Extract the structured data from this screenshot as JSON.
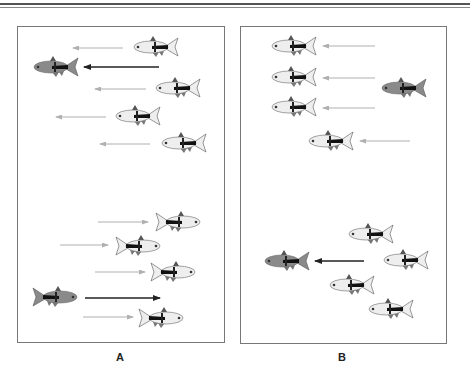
{
  "figure": {
    "panels": [
      {
        "id": "A",
        "label": "A",
        "description": "Followers track a leader moving left (top group) and right (bottom group)"
      },
      {
        "id": "B",
        "label": "B",
        "description": "Group moves left, leader separates; leader moves left, group remains"
      }
    ]
  },
  "colors": {
    "rule": "#555555",
    "panel_border": "#777777",
    "leader_arrow": "#222222",
    "follower_arrow": "#b0b0b0",
    "leader_fish_body": "#8a8a8a",
    "follower_fish_body": "#eeeeee"
  },
  "fish": [
    {
      "panel": "A",
      "type": "follower",
      "x": 132,
      "y": 47,
      "dir": "left"
    },
    {
      "panel": "A",
      "type": "leader",
      "x": 32,
      "y": 67,
      "dir": "left"
    },
    {
      "panel": "A",
      "type": "follower",
      "x": 154,
      "y": 88,
      "dir": "left"
    },
    {
      "panel": "A",
      "type": "follower",
      "x": 114,
      "y": 116,
      "dir": "left"
    },
    {
      "panel": "A",
      "type": "follower",
      "x": 160,
      "y": 143,
      "dir": "left"
    },
    {
      "panel": "A",
      "type": "follower",
      "x": 155,
      "y": 222,
      "dir": "right"
    },
    {
      "panel": "A",
      "type": "follower",
      "x": 115,
      "y": 246,
      "dir": "right"
    },
    {
      "panel": "A",
      "type": "follower",
      "x": 150,
      "y": 272,
      "dir": "right"
    },
    {
      "panel": "A",
      "type": "leader",
      "x": 32,
      "y": 297,
      "dir": "right"
    },
    {
      "panel": "A",
      "type": "follower",
      "x": 138,
      "y": 318,
      "dir": "right"
    },
    {
      "panel": "B",
      "type": "follower",
      "x": 270,
      "y": 46,
      "dir": "left"
    },
    {
      "panel": "B",
      "type": "follower",
      "x": 270,
      "y": 77,
      "dir": "left"
    },
    {
      "panel": "B",
      "type": "leader",
      "x": 380,
      "y": 88,
      "dir": "left"
    },
    {
      "panel": "B",
      "type": "follower",
      "x": 270,
      "y": 107,
      "dir": "left"
    },
    {
      "panel": "B",
      "type": "follower",
      "x": 307,
      "y": 141,
      "dir": "left"
    },
    {
      "panel": "B",
      "type": "follower",
      "x": 347,
      "y": 234,
      "dir": "left"
    },
    {
      "panel": "B",
      "type": "leader",
      "x": 263,
      "y": 261,
      "dir": "left"
    },
    {
      "panel": "B",
      "type": "follower",
      "x": 382,
      "y": 260,
      "dir": "left"
    },
    {
      "panel": "B",
      "type": "follower",
      "x": 328,
      "y": 285,
      "dir": "left"
    },
    {
      "panel": "B",
      "type": "follower",
      "x": 367,
      "y": 309,
      "dir": "left"
    }
  ],
  "arrows": [
    {
      "panel": "A",
      "type": "follower",
      "x1": 123,
      "x2": 73,
      "y": 48
    },
    {
      "panel": "A",
      "type": "leader",
      "x1": 159,
      "x2": 84,
      "y": 67
    },
    {
      "panel": "A",
      "type": "follower",
      "x1": 146,
      "x2": 95,
      "y": 89
    },
    {
      "panel": "A",
      "type": "follower",
      "x1": 106,
      "x2": 56,
      "y": 117
    },
    {
      "panel": "A",
      "type": "follower",
      "x1": 150,
      "x2": 100,
      "y": 144
    },
    {
      "panel": "A",
      "type": "follower",
      "x1": 98,
      "x2": 148,
      "y": 222
    },
    {
      "panel": "A",
      "type": "follower",
      "x1": 60,
      "x2": 108,
      "y": 245
    },
    {
      "panel": "A",
      "type": "follower",
      "x1": 95,
      "x2": 145,
      "y": 272
    },
    {
      "panel": "A",
      "type": "leader",
      "x1": 85,
      "x2": 160,
      "y": 298
    },
    {
      "panel": "A",
      "type": "follower",
      "x1": 83,
      "x2": 133,
      "y": 317
    },
    {
      "panel": "B",
      "type": "follower",
      "x1": 375,
      "x2": 323,
      "y": 46
    },
    {
      "panel": "B",
      "type": "follower",
      "x1": 375,
      "x2": 323,
      "y": 78
    },
    {
      "panel": "B",
      "type": "follower",
      "x1": 375,
      "x2": 323,
      "y": 108
    },
    {
      "panel": "B",
      "type": "follower",
      "x1": 410,
      "x2": 360,
      "y": 141
    },
    {
      "panel": "B",
      "type": "leader",
      "x1": 364,
      "x2": 315,
      "y": 261
    }
  ]
}
